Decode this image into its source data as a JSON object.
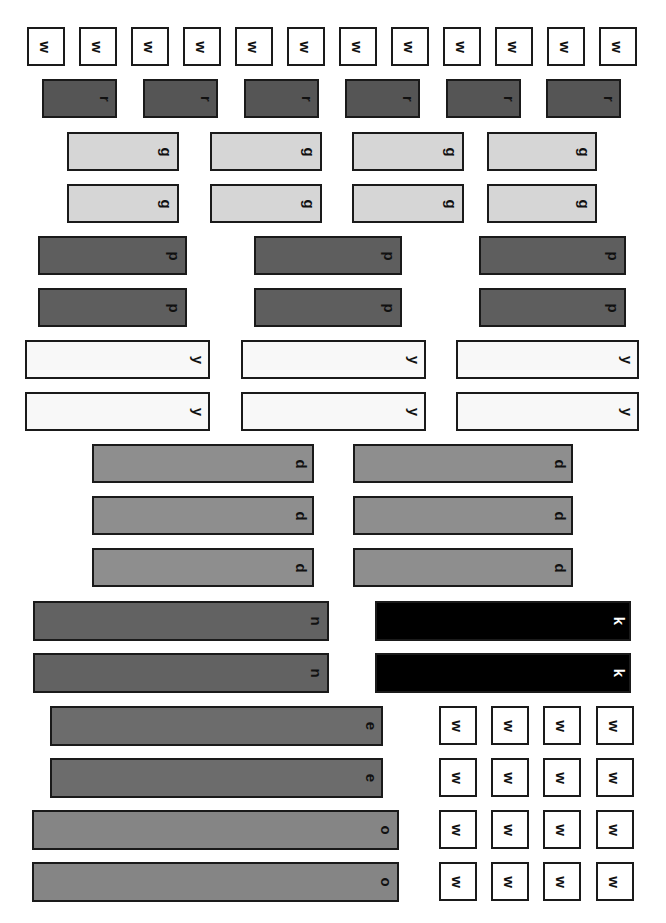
{
  "colors": {
    "w": "#ffffff",
    "r": "#555555",
    "g": "#d6d6d6",
    "p": "#5e5e5e",
    "y": "#f8f8f8",
    "d": "#8e8e8e",
    "k": "#000000",
    "n": "#626262",
    "e": "#6c6c6c",
    "o": "#858585"
  },
  "rods": [
    {
      "c": "w",
      "x": 27,
      "y": 27,
      "w": 38,
      "h": 39
    },
    {
      "c": "w",
      "x": 79,
      "y": 27,
      "w": 38,
      "h": 39
    },
    {
      "c": "w",
      "x": 131,
      "y": 27,
      "w": 38,
      "h": 39
    },
    {
      "c": "w",
      "x": 183,
      "y": 27,
      "w": 38,
      "h": 39
    },
    {
      "c": "w",
      "x": 235,
      "y": 27,
      "w": 38,
      "h": 39
    },
    {
      "c": "w",
      "x": 287,
      "y": 27,
      "w": 38,
      "h": 39
    },
    {
      "c": "w",
      "x": 339,
      "y": 27,
      "w": 38,
      "h": 39
    },
    {
      "c": "w",
      "x": 391,
      "y": 27,
      "w": 38,
      "h": 39
    },
    {
      "c": "w",
      "x": 443,
      "y": 27,
      "w": 38,
      "h": 39
    },
    {
      "c": "w",
      "x": 495,
      "y": 27,
      "w": 38,
      "h": 39
    },
    {
      "c": "w",
      "x": 547,
      "y": 27,
      "w": 38,
      "h": 39
    },
    {
      "c": "w",
      "x": 599,
      "y": 27,
      "w": 38,
      "h": 39
    },
    {
      "c": "r",
      "x": 42,
      "y": 79,
      "w": 75,
      "h": 39
    },
    {
      "c": "r",
      "x": 143,
      "y": 79,
      "w": 75,
      "h": 39
    },
    {
      "c": "r",
      "x": 244,
      "y": 79,
      "w": 75,
      "h": 39
    },
    {
      "c": "r",
      "x": 345,
      "y": 79,
      "w": 75,
      "h": 39
    },
    {
      "c": "r",
      "x": 446,
      "y": 79,
      "w": 75,
      "h": 39
    },
    {
      "c": "r",
      "x": 546,
      "y": 79,
      "w": 75,
      "h": 39
    },
    {
      "c": "g",
      "x": 67,
      "y": 132,
      "w": 112,
      "h": 39
    },
    {
      "c": "g",
      "x": 210,
      "y": 132,
      "w": 112,
      "h": 39
    },
    {
      "c": "g",
      "x": 352,
      "y": 132,
      "w": 112,
      "h": 39
    },
    {
      "c": "g",
      "x": 487,
      "y": 132,
      "w": 110,
      "h": 39
    },
    {
      "c": "g",
      "x": 67,
      "y": 184,
      "w": 112,
      "h": 39
    },
    {
      "c": "g",
      "x": 210,
      "y": 184,
      "w": 112,
      "h": 39
    },
    {
      "c": "g",
      "x": 352,
      "y": 184,
      "w": 112,
      "h": 39
    },
    {
      "c": "g",
      "x": 487,
      "y": 184,
      "w": 110,
      "h": 39
    },
    {
      "c": "p",
      "x": 38,
      "y": 236,
      "w": 149,
      "h": 39
    },
    {
      "c": "p",
      "x": 254,
      "y": 236,
      "w": 148,
      "h": 39
    },
    {
      "c": "p",
      "x": 479,
      "y": 236,
      "w": 147,
      "h": 39
    },
    {
      "c": "p",
      "x": 38,
      "y": 288,
      "w": 149,
      "h": 39
    },
    {
      "c": "p",
      "x": 254,
      "y": 288,
      "w": 148,
      "h": 39
    },
    {
      "c": "p",
      "x": 479,
      "y": 288,
      "w": 147,
      "h": 39
    },
    {
      "c": "y",
      "x": 25,
      "y": 340,
      "w": 185,
      "h": 39
    },
    {
      "c": "y",
      "x": 241,
      "y": 340,
      "w": 185,
      "h": 39
    },
    {
      "c": "y",
      "x": 456,
      "y": 340,
      "w": 183,
      "h": 39
    },
    {
      "c": "y",
      "x": 25,
      "y": 392,
      "w": 185,
      "h": 39
    },
    {
      "c": "y",
      "x": 241,
      "y": 392,
      "w": 185,
      "h": 39
    },
    {
      "c": "y",
      "x": 456,
      "y": 392,
      "w": 183,
      "h": 39
    },
    {
      "c": "d",
      "x": 92,
      "y": 444,
      "w": 222,
      "h": 39
    },
    {
      "c": "d",
      "x": 353,
      "y": 444,
      "w": 220,
      "h": 39
    },
    {
      "c": "d",
      "x": 92,
      "y": 496,
      "w": 222,
      "h": 39
    },
    {
      "c": "d",
      "x": 353,
      "y": 496,
      "w": 220,
      "h": 39
    },
    {
      "c": "d",
      "x": 92,
      "y": 548,
      "w": 222,
      "h": 39
    },
    {
      "c": "d",
      "x": 353,
      "y": 548,
      "w": 220,
      "h": 39
    },
    {
      "c": "n",
      "x": 33,
      "y": 601,
      "w": 296,
      "h": 40
    },
    {
      "c": "k",
      "x": 375,
      "y": 601,
      "w": 256,
      "h": 40
    },
    {
      "c": "n",
      "x": 33,
      "y": 653,
      "w": 296,
      "h": 40
    },
    {
      "c": "k",
      "x": 375,
      "y": 653,
      "w": 256,
      "h": 40
    },
    {
      "c": "e",
      "x": 50,
      "y": 706,
      "w": 333,
      "h": 40
    },
    {
      "c": "e",
      "x": 50,
      "y": 758,
      "w": 333,
      "h": 40
    },
    {
      "c": "o",
      "x": 32,
      "y": 810,
      "w": 367,
      "h": 40
    },
    {
      "c": "o",
      "x": 32,
      "y": 862,
      "w": 367,
      "h": 40
    },
    {
      "c": "w",
      "x": 439,
      "y": 706,
      "w": 38,
      "h": 39
    },
    {
      "c": "w",
      "x": 491,
      "y": 706,
      "w": 38,
      "h": 39
    },
    {
      "c": "w",
      "x": 543,
      "y": 706,
      "w": 38,
      "h": 39
    },
    {
      "c": "w",
      "x": 596,
      "y": 706,
      "w": 38,
      "h": 39
    },
    {
      "c": "w",
      "x": 439,
      "y": 758,
      "w": 38,
      "h": 39
    },
    {
      "c": "w",
      "x": 491,
      "y": 758,
      "w": 38,
      "h": 39
    },
    {
      "c": "w",
      "x": 543,
      "y": 758,
      "w": 38,
      "h": 39
    },
    {
      "c": "w",
      "x": 596,
      "y": 758,
      "w": 38,
      "h": 39
    },
    {
      "c": "w",
      "x": 439,
      "y": 810,
      "w": 38,
      "h": 39
    },
    {
      "c": "w",
      "x": 491,
      "y": 810,
      "w": 38,
      "h": 39
    },
    {
      "c": "w",
      "x": 543,
      "y": 810,
      "w": 38,
      "h": 39
    },
    {
      "c": "w",
      "x": 596,
      "y": 810,
      "w": 38,
      "h": 39
    },
    {
      "c": "w",
      "x": 439,
      "y": 862,
      "w": 38,
      "h": 39
    },
    {
      "c": "w",
      "x": 491,
      "y": 862,
      "w": 38,
      "h": 39
    },
    {
      "c": "w",
      "x": 543,
      "y": 862,
      "w": 38,
      "h": 39
    },
    {
      "c": "w",
      "x": 596,
      "y": 862,
      "w": 38,
      "h": 39
    }
  ]
}
